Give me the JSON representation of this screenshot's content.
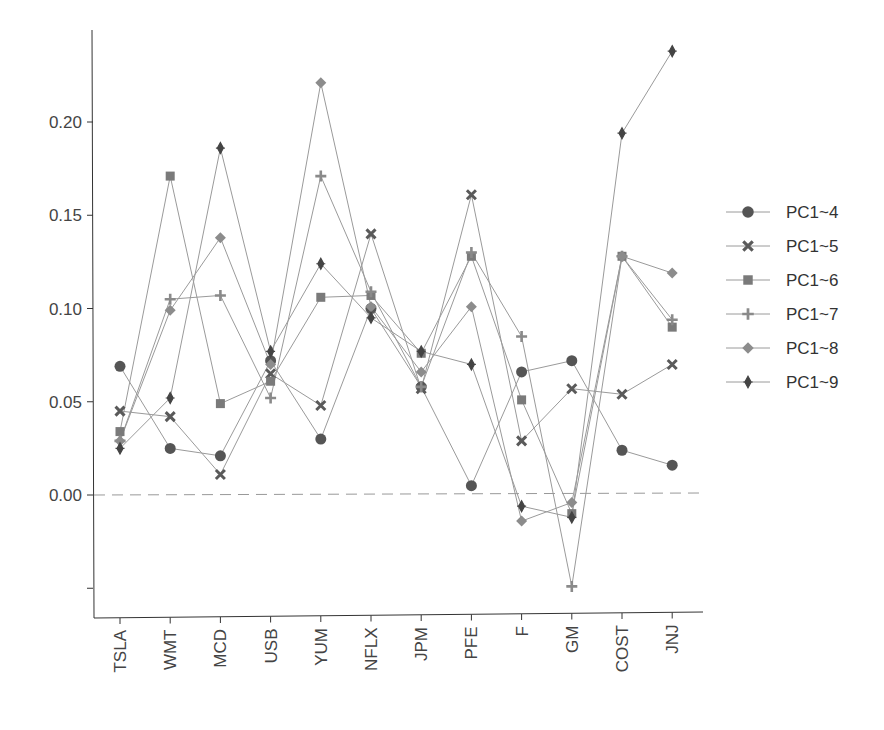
{
  "chart_data": {
    "type": "line",
    "title": "",
    "xlabel": "",
    "ylabel": "",
    "categories": [
      "TSLA",
      "WMT",
      "MCD",
      "USB",
      "YUM",
      "NFLX",
      "JPM",
      "PFE",
      "F",
      "GM",
      "COST",
      "JNJ"
    ],
    "ylim": [
      -0.065,
      0.25
    ],
    "yticks": [
      {
        "value": -0.05,
        "label": ""
      },
      {
        "value": 0.0,
        "label": "0.00"
      },
      {
        "value": 0.05,
        "label": "0.05"
      },
      {
        "value": 0.1,
        "label": "0.10"
      },
      {
        "value": 0.15,
        "label": "0.15"
      },
      {
        "value": 0.2,
        "label": "0.20"
      }
    ],
    "reference_line": {
      "value": 0.0,
      "style": "dashed"
    },
    "grid": false,
    "legend_position": "right",
    "series": [
      {
        "name": "PC1~4",
        "marker": "circle",
        "color": "#555555",
        "values": [
          0.069,
          0.025,
          0.021,
          0.072,
          0.03,
          0.1,
          0.058,
          0.005,
          0.066,
          0.072,
          0.024,
          0.016
        ]
      },
      {
        "name": "PC1~5",
        "marker": "x",
        "color": "#5a5a5a",
        "values": [
          0.045,
          0.042,
          0.011,
          0.065,
          0.048,
          0.14,
          0.057,
          0.161,
          0.029,
          0.057,
          0.054,
          0.07
        ]
      },
      {
        "name": "PC1~6",
        "marker": "square",
        "color": "#7a7a7a",
        "values": [
          0.034,
          0.171,
          0.049,
          0.061,
          0.106,
          0.107,
          0.076,
          0.128,
          0.051,
          -0.01,
          0.128,
          0.09
        ]
      },
      {
        "name": "PC1~7",
        "marker": "plus",
        "color": "#8a8a8a",
        "values": [
          0.029,
          0.105,
          0.107,
          0.052,
          0.171,
          0.109,
          0.058,
          0.13,
          0.085,
          -0.049,
          0.128,
          0.094
        ]
      },
      {
        "name": "PC1~8",
        "marker": "diamond",
        "color": "#8c8c8c",
        "values": [
          0.029,
          0.099,
          0.138,
          0.07,
          0.221,
          0.101,
          0.066,
          0.101,
          -0.014,
          -0.004,
          0.128,
          0.119
        ]
      },
      {
        "name": "PC1~9",
        "marker": "thin-diamond",
        "color": "#444444",
        "values": [
          0.025,
          0.052,
          0.186,
          0.077,
          0.124,
          0.095,
          0.077,
          0.07,
          -0.006,
          -0.012,
          0.194,
          0.238
        ]
      }
    ]
  }
}
